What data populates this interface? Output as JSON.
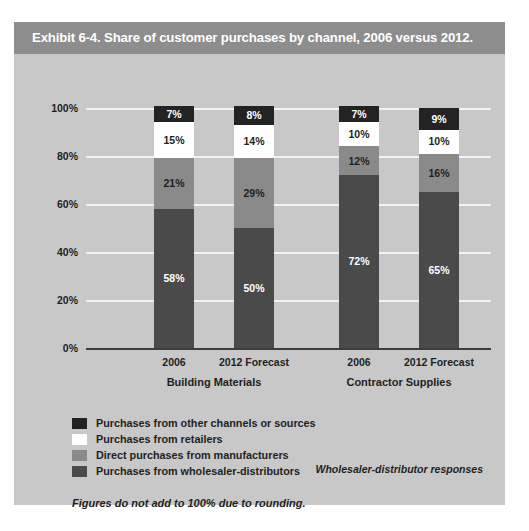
{
  "exhibit": {
    "title": "Exhibit 6-4. Share of customer purchases by channel, 2006 versus 2012.",
    "responses_note": "Wholesaler-distributor responses",
    "footnote": "Figures do not add to 100% due to rounding."
  },
  "colors": {
    "panel_background": "#c8c8c8",
    "title_bar": "#8d8d8d",
    "title_text": "#ffffff",
    "gridline": "#f2f2f2",
    "axis": "#3c3c3c",
    "other_channels": "#232323",
    "retailers": "#ffffff",
    "manufacturers": "#8a8a8a",
    "wholesaler_distributors": "#4a4a4a"
  },
  "chart_data": {
    "type": "bar",
    "subtype": "stacked-column",
    "title": "Exhibit 6-4. Share of customer purchases by channel, 2006 versus 2012.",
    "xlabel": "",
    "ylabel": "",
    "ylim": [
      0,
      100
    ],
    "yticks": [
      "0%",
      "20%",
      "40%",
      "60%",
      "80%",
      "100%"
    ],
    "grid": true,
    "legend_position": "bottom-left",
    "groups": [
      "Building Materials",
      "Contractor Supplies"
    ],
    "categories": [
      "2006",
      "2012 Forecast",
      "2006",
      "2012 Forecast"
    ],
    "series": [
      {
        "name": "Purchases from wholesaler-distributors",
        "color": "#4a4a4a",
        "label_color": "#ffffff",
        "values": [
          58,
          50,
          72,
          65
        ],
        "labels": [
          "58%",
          "50%",
          "72%",
          "65%"
        ]
      },
      {
        "name": "Direct purchases from manufacturers",
        "color": "#8a8a8a",
        "label_color": "#1f1f1f",
        "values": [
          21,
          29,
          12,
          16
        ],
        "labels": [
          "21%",
          "29%",
          "12%",
          "16%"
        ]
      },
      {
        "name": "Purchases from retailers",
        "color": "#ffffff",
        "label_color": "#1f1f1f",
        "values": [
          15,
          14,
          10,
          10
        ],
        "labels": [
          "15%",
          "14%",
          "10%",
          "10%"
        ]
      },
      {
        "name": "Purchases from other channels or sources",
        "color": "#232323",
        "label_color": "#ffffff",
        "values": [
          7,
          8,
          7,
          9
        ],
        "labels": [
          "7%",
          "8%",
          "7%",
          "9%"
        ]
      }
    ]
  },
  "axis": {
    "ticks": [
      {
        "label": "100%",
        "value": 100
      },
      {
        "label": "80%",
        "value": 80
      },
      {
        "label": "60%",
        "value": 60
      },
      {
        "label": "40%",
        "value": 40
      },
      {
        "label": "20%",
        "value": 20
      },
      {
        "label": "0%",
        "value": 0
      }
    ]
  },
  "x_axis": {
    "ticks": [
      {
        "label": "2006"
      },
      {
        "label": "2012 Forecast"
      },
      {
        "label": "2006"
      },
      {
        "label": "2012 Forecast"
      }
    ],
    "groups": [
      {
        "label": "Building Materials"
      },
      {
        "label": "Contractor Supplies"
      }
    ]
  },
  "legend": {
    "items": [
      {
        "label": "Purchases from other channels or sources",
        "color": "#232323"
      },
      {
        "label": "Purchases from retailers",
        "color": "#ffffff"
      },
      {
        "label": "Direct purchases from manufacturers",
        "color": "#8a8a8a"
      },
      {
        "label": "Purchases from wholesaler-distributors",
        "color": "#4a4a4a"
      }
    ]
  }
}
